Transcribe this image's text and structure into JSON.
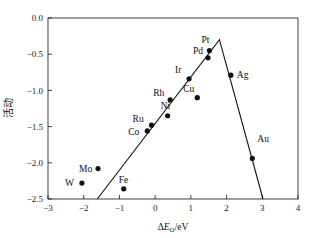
{
  "chart_data": {
    "type": "scatter",
    "title": "",
    "xlabel": "ΔEₒ/eV",
    "xlabel_parts": {
      "delta": "Δ",
      "symbol": "E",
      "subscript": "O",
      "units": "/eV"
    },
    "ylabel": "活动",
    "xlim": [
      -3,
      4
    ],
    "ylim": [
      -2.5,
      0.0
    ],
    "xticks": [
      -3,
      -2,
      -1,
      0,
      1,
      2,
      3,
      4
    ],
    "xtick_labels": [
      "−3",
      "−2",
      "−1",
      "0",
      "1",
      "2",
      "3",
      "4"
    ],
    "yticks": [
      0.0,
      -0.5,
      -1.0,
      -1.5,
      -2.0,
      -2.5
    ],
    "ytick_labels": [
      "0.0",
      "−0.5",
      "−1.0",
      "−1.5",
      "−2.0",
      "−2.5"
    ],
    "grid": false,
    "legend": "none",
    "marker_color": "#111111",
    "line_color": "#111111",
    "axis_color": "#2b2b2b",
    "points": [
      {
        "label": "W",
        "x": -2.05,
        "y": -2.28,
        "label_dx": -17,
        "label_dy": 3
      },
      {
        "label": "Mo",
        "x": -1.6,
        "y": -2.08,
        "label_dx": -19,
        "label_dy": 3
      },
      {
        "label": "Fe",
        "x": -0.88,
        "y": -2.36,
        "label_dx": -5,
        "label_dy": -6
      },
      {
        "label": "Co",
        "x": -0.22,
        "y": -1.56,
        "label_dx": -19,
        "label_dy": 4
      },
      {
        "label": "Ru",
        "x": -0.1,
        "y": -1.48,
        "label_dx": -19,
        "label_dy": -3
      },
      {
        "label": "Ni",
        "x": 0.35,
        "y": -1.35,
        "label_dx": -7,
        "label_dy": -7
      },
      {
        "label": "Rh",
        "x": 0.42,
        "y": -1.13,
        "label_dx": -17,
        "label_dy": -4
      },
      {
        "label": "Cu",
        "x": 1.18,
        "y": -1.1,
        "label_dx": -14,
        "label_dy": -6
      },
      {
        "label": "Ir",
        "x": 0.95,
        "y": -0.84,
        "label_dx": -14,
        "label_dy": -6
      },
      {
        "label": "Pd",
        "x": 1.48,
        "y": -0.55,
        "label_dx": -15,
        "label_dy": -4
      },
      {
        "label": "Pt",
        "x": 1.52,
        "y": -0.45,
        "label_dx": -8,
        "label_dy": -8
      },
      {
        "label": "Ag",
        "x": 2.12,
        "y": -0.79,
        "label_dx": 6,
        "label_dy": 3
      },
      {
        "label": "Au",
        "x": 2.72,
        "y": -1.94,
        "label_dx": 5,
        "label_dy": -16
      }
    ],
    "volcano_line": {
      "description": "two-branch volcano trend line",
      "vertices": [
        {
          "x": -1.62,
          "y": -2.5
        },
        {
          "x": 1.8,
          "y": -0.3
        },
        {
          "x": 3.02,
          "y": -2.5
        }
      ]
    }
  }
}
